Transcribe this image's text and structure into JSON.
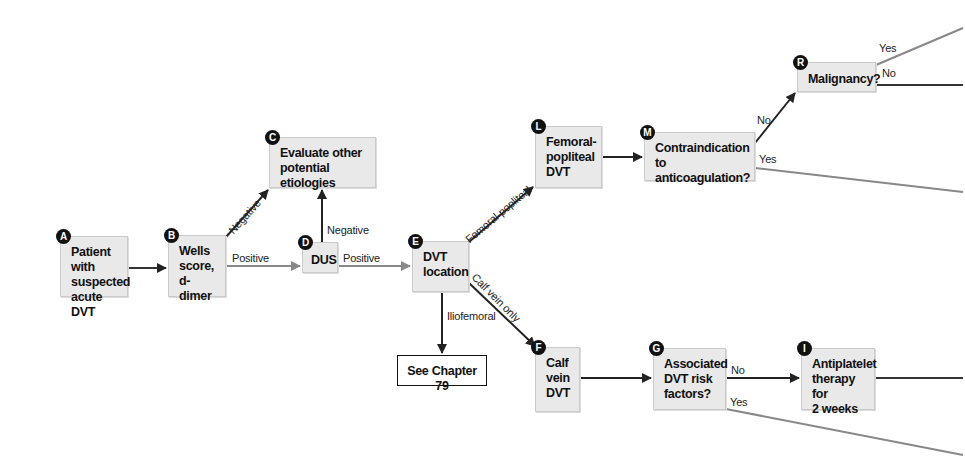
{
  "diagram": {
    "type": "clinical-flowchart",
    "colors": {
      "node_fill": "#e9e9e9",
      "node_border": "#cbcbcb",
      "arrow_dark": "#222222",
      "arrow_gray": "#888888",
      "badge": "#111111"
    },
    "nodes": {
      "A": {
        "badge": "A",
        "text": "Patient with\nsuspected\nacute DVT"
      },
      "B": {
        "badge": "B",
        "text": "Wells\nscore,\nd-dimer"
      },
      "C": {
        "badge": "C",
        "text": "Evaluate other\npotential etiologies"
      },
      "D": {
        "badge": "D",
        "text": "DUS"
      },
      "E": {
        "badge": "E",
        "text": "DVT\nlocation"
      },
      "chapter": {
        "text": "See Chapter 79"
      },
      "L": {
        "badge": "L",
        "text": "Femoral-\npopliteal\nDVT"
      },
      "M": {
        "badge": "M",
        "text": "Contraindication\nto anticoagulation?"
      },
      "R": {
        "badge": "R",
        "text": "Malignancy?"
      },
      "F": {
        "badge": "F",
        "text": "Calf\nvein\nDVT"
      },
      "G": {
        "badge": "G",
        "text": "Associated\nDVT risk\nfactors?"
      },
      "I": {
        "badge": "I",
        "text": "Antiplatelet\ntherapy for\n2 weeks"
      }
    },
    "edge_labels": {
      "b_to_c": "Negative",
      "b_to_d": "Positive",
      "d_to_c": "Negative",
      "d_to_e": "Positive",
      "e_to_l": "Femoral-popliteal",
      "e_to_f": "Calf vein only",
      "e_to_chapter": "Iliofemoral",
      "m_to_r": "No",
      "m_yes": "Yes",
      "r_yes": "Yes",
      "r_no": "No",
      "g_to_i": "No",
      "g_yes": "Yes"
    }
  }
}
